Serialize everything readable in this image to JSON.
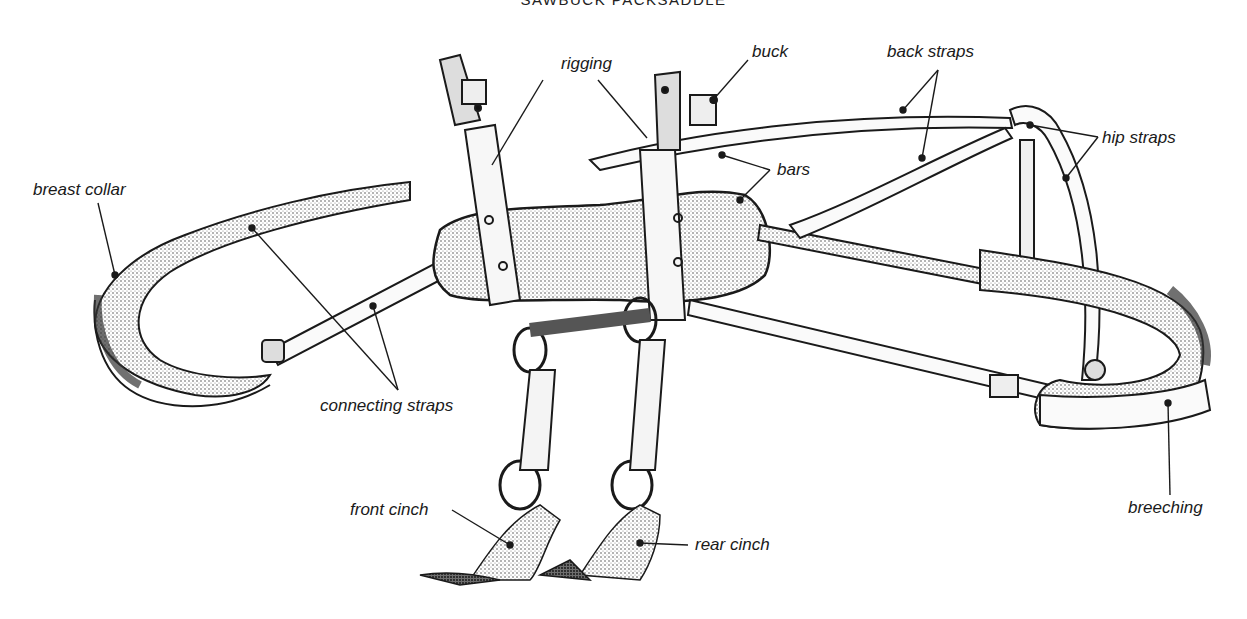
{
  "title": "SAWBUCK PACKSADDLE",
  "labels": {
    "rigging": "rigging",
    "buck": "buck",
    "back_straps": "back straps",
    "hip_straps": "hip straps",
    "bars": "bars",
    "breast_collar": "breast collar",
    "connecting_straps": "connecting straps",
    "front_cinch": "front cinch",
    "rear_cinch": "rear cinch",
    "breeching": "breeching"
  },
  "colors": {
    "ink": "#1a1a1a",
    "shade": "#6e6e6e",
    "light_shade": "#c9c9c9",
    "background": "#ffffff"
  }
}
